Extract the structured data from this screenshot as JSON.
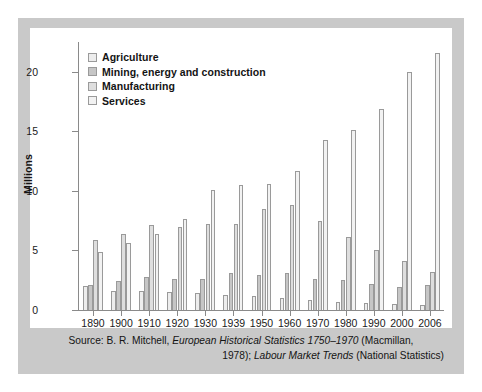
{
  "chart_data": {
    "type": "bar",
    "title": "",
    "subtitle": "",
    "xlabel": "",
    "ylabel": "Millions",
    "ylim": [
      0,
      22.5
    ],
    "yticks": [
      0,
      5,
      10,
      15,
      20
    ],
    "grid": false,
    "legend_position": "top-left",
    "categories": [
      "1890",
      "1900",
      "1910",
      "1920",
      "1930",
      "1939",
      "1950",
      "1960",
      "1970",
      "1980",
      "1990",
      "2000",
      "2006"
    ],
    "series": [
      {
        "name": "Agriculture",
        "color": "#ededed",
        "values": [
          2.0,
          1.6,
          1.6,
          1.5,
          1.4,
          1.3,
          1.2,
          1.0,
          0.8,
          0.7,
          0.6,
          0.5,
          0.4
        ]
      },
      {
        "name": "Mining, energy and construction",
        "color": "#c6c6c6",
        "values": [
          2.1,
          2.4,
          2.8,
          2.6,
          2.6,
          3.1,
          2.9,
          3.1,
          2.6,
          2.5,
          2.2,
          1.9,
          2.1
        ]
      },
      {
        "name": "Manufacturing",
        "color": "#dedede",
        "values": [
          5.9,
          6.4,
          7.1,
          7.0,
          7.2,
          7.2,
          8.5,
          8.8,
          7.5,
          6.1,
          5.0,
          4.1,
          3.2
        ]
      },
      {
        "name": "Services",
        "color": "#f2f2f2",
        "values": [
          4.9,
          5.6,
          6.4,
          7.6,
          10.1,
          10.5,
          10.6,
          11.7,
          14.3,
          15.1,
          16.9,
          20.0,
          21.6
        ]
      }
    ],
    "legend": [
      "Agriculture",
      "Mining, energy and construction",
      "Manufacturing",
      "Services"
    ]
  },
  "caption": {
    "line1_a": "Source: B. R. Mitchell, ",
    "line1_italic": "European Historical Statistics 1750–1970",
    "line1_b": " (Macmillan,",
    "line2_a": "1978); ",
    "line2_italic": "Labour Market Trends",
    "line2_b": " (National Statistics)"
  },
  "colors": {
    "frame": "#c9c9c9",
    "panel": "#ffffff",
    "axis": "#8a8a8a",
    "bar_outline": "#9a9a9a",
    "text": "#141414"
  }
}
